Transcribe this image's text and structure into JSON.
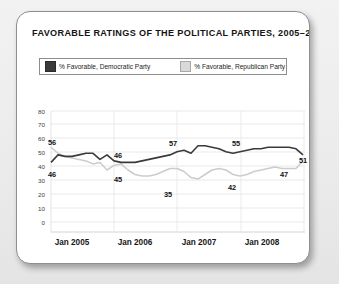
{
  "chart_data": {
    "type": "line",
    "title": "FAVORABLE RATINGS OF THE POLITICAL PARTIES, 2005–2008",
    "xlabel": "",
    "ylabel": "",
    "ylim": [
      0,
      80
    ],
    "yticks": [
      0,
      10,
      20,
      30,
      40,
      50,
      60,
      70,
      80
    ],
    "ytick_labels": [
      "0",
      "10",
      "20",
      "30",
      "40",
      "50",
      "60",
      "70",
      "80"
    ],
    "xtick_labels": [
      "Jan 2005",
      "Jan 2006",
      "Jan 2007",
      "Jan 2008"
    ],
    "grid": true,
    "legend_position": "top",
    "series": [
      {
        "name": "% Favorable, Democratic Party",
        "color": "#3a3a3a",
        "values": [
          46,
          51,
          50,
          50,
          51,
          52,
          52,
          48,
          51,
          47,
          46,
          46,
          46,
          47,
          48,
          49,
          50,
          51,
          53,
          54,
          52,
          57,
          57,
          56,
          55,
          53,
          52,
          53,
          54,
          55,
          55,
          56,
          56,
          56,
          56,
          55,
          51
        ]
      },
      {
        "name": "% Favorable, Republican Party",
        "color": "#cccccc",
        "values": [
          56,
          52,
          50,
          49,
          48,
          47,
          45,
          46,
          41,
          44,
          45,
          41,
          38,
          37,
          37,
          38,
          40,
          42,
          42,
          40,
          36,
          35,
          38,
          41,
          42,
          41,
          38,
          37,
          38,
          40,
          41,
          42,
          43,
          42,
          42,
          42,
          47
        ]
      }
    ],
    "point_labels": [
      {
        "text": "56",
        "series": "% Favorable, Republican Party",
        "value": 56
      },
      {
        "text": "46",
        "series": "% Favorable, Democratic Party",
        "value": 46
      },
      {
        "text": "46",
        "series": "% Favorable, Democratic Party",
        "value": 46
      },
      {
        "text": "45",
        "series": "% Favorable, Republican Party",
        "value": 45
      },
      {
        "text": "57",
        "series": "% Favorable, Democratic Party",
        "value": 57
      },
      {
        "text": "35",
        "series": "% Favorable, Republican Party",
        "value": 35
      },
      {
        "text": "55",
        "series": "% Favorable, Democratic Party",
        "value": 55
      },
      {
        "text": "42",
        "series": "% Favorable, Republican Party",
        "value": 42
      },
      {
        "text": "47",
        "series": "% Favorable, Republican Party",
        "value": 47
      },
      {
        "text": "51",
        "series": "% Favorable, Democratic Party",
        "value": 51
      }
    ]
  },
  "legend": {
    "democratic": "% Favorable, Democratic Party",
    "republican": "% Favorable, Republican Party"
  },
  "yticks": {
    "t0": "0",
    "t1": "10",
    "t2": "20",
    "t3": "30",
    "t4": "40",
    "t5": "50",
    "t6": "60",
    "t7": "70",
    "t8": "80"
  },
  "xticks": {
    "x0": "Jan 2005",
    "x1": "Jan 2006",
    "x2": "Jan 2007",
    "x3": "Jan 2008"
  },
  "labels": {
    "l56": "56",
    "l46a": "46",
    "l46b": "46",
    "l45": "45",
    "l57": "57",
    "l35": "35",
    "l55": "55",
    "l42": "42",
    "l47": "47",
    "l51": "51"
  },
  "colors": {
    "democratic": "#3a3a3a",
    "republican": "#cccccc",
    "card_border": "#8e8e8e",
    "grid": "#e2e2e2",
    "page_background": "#efefef"
  }
}
